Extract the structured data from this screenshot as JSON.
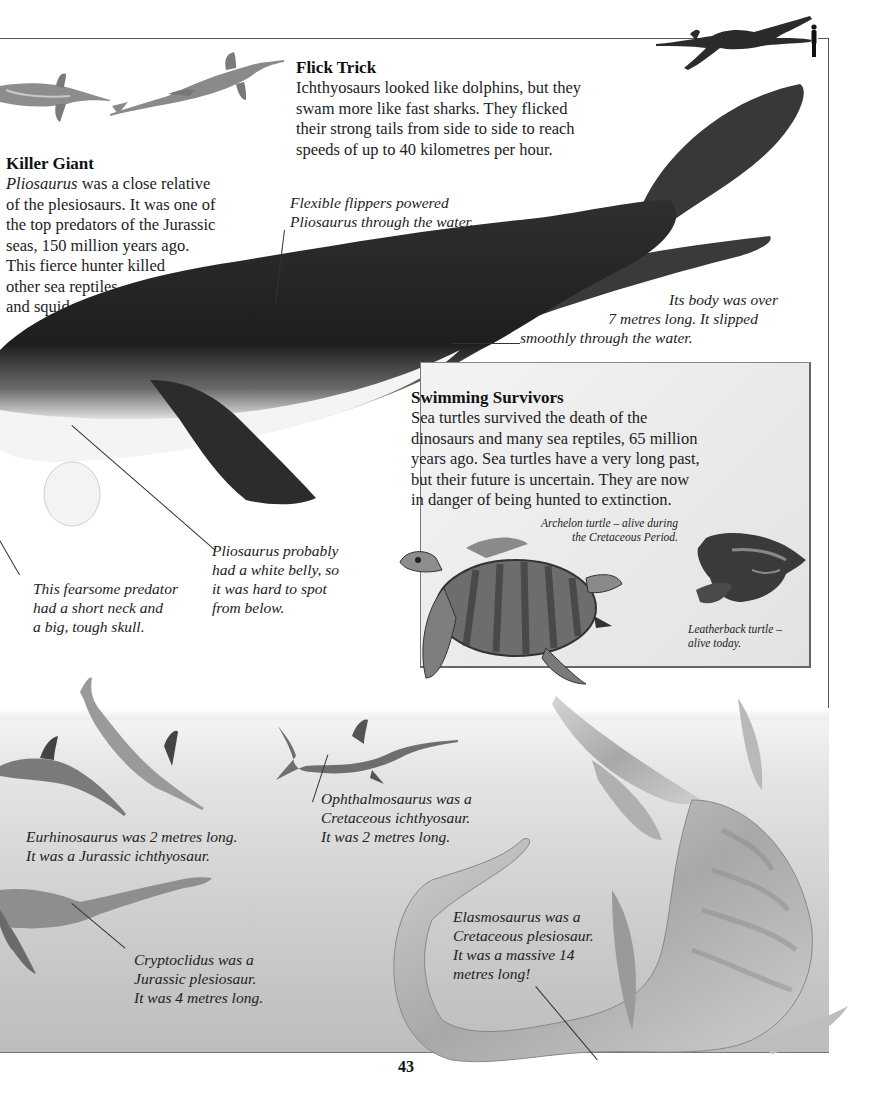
{
  "page": {
    "number": "43"
  },
  "flick_trick": {
    "heading": "Flick Trick",
    "lines": [
      "Ichthyosaurs looked like dolphins, but they",
      "swam more like fast sharks. They flicked",
      "their strong tails from side to side to reach",
      "speeds of up to 40 kilometres per hour."
    ]
  },
  "killer_giant": {
    "heading": "Killer Giant",
    "italic_lead": "Pliosaurus",
    "first_line_rest": " was a close relative",
    "lines": [
      "of the plesiosaurs. It was one of",
      "the top predators of the Jurassic",
      "seas, 150 million years ago.",
      "This fierce hunter killed",
      "other sea reptiles",
      "and squid."
    ]
  },
  "captions": {
    "flippers": [
      "Flexible flippers powered",
      "Pliosaurus through the water."
    ],
    "body_length": [
      "Its body was over",
      "7 metres long. It slipped",
      "smoothly through the water."
    ],
    "predator_skull": [
      "This fearsome predator",
      "had a short neck and",
      "a big, tough skull."
    ],
    "white_belly": [
      "Pliosaurus probably",
      "had a white belly, so",
      "it was hard to spot",
      "from below."
    ],
    "eurhinosaurus": [
      "Eurhinosaurus was 2 metres long.",
      "It was a Jurassic ichthyosaur."
    ],
    "ophthalmosaurus": [
      "Ophthalmosaurus was a",
      "Cretaceous ichthyosaur.",
      "It was 2 metres long."
    ],
    "cryptoclidus": [
      "Cryptoclidus was a",
      "Jurassic plesiosaur.",
      "It was 4 metres long."
    ],
    "elasmosaurus": [
      "Elasmosaurus was a",
      "Cretaceous plesiosaur.",
      "It was a massive 14",
      "metres long!"
    ]
  },
  "swimming_survivors": {
    "heading": "Swimming Survivors",
    "lines": [
      "Sea turtles survived the death of the",
      "dinosaurs and many sea reptiles, 65 million",
      "years ago. Sea turtles have a very long past,",
      "but their future is uncertain. They are now",
      "in danger of being hunted to extinction."
    ],
    "archelon_caption": [
      "Archelon turtle – alive during",
      "the Cretaceous Period."
    ],
    "leatherback_caption": [
      "Leatherback turtle –",
      "alive today."
    ]
  },
  "illustrations": {
    "scale_figure": "pliosaurus-vs-human-scale-icon",
    "colors": {
      "pliosaurus_dark": "#2a2a2a",
      "pliosaurus_belly": "#f2f2f2",
      "turtle_body": "#6f6f6f",
      "panel_bg": "#e9e9e9",
      "sea_gray": "#c8c8c8"
    }
  }
}
